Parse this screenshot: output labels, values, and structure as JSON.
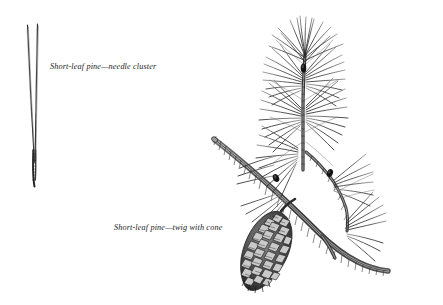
{
  "plate": {
    "background_color": "#ffffff",
    "ink_color": "#1b1b1b",
    "subject": "Short-leaf pine",
    "medium": "pen-and-ink botanical illustration"
  },
  "captions": {
    "needle_cluster": "Short-leaf pine—needle cluster",
    "twig_with_cone": "Short-leaf pine—twig with cone"
  },
  "figures": [
    {
      "id": "needle-cluster",
      "label": "Short-leaf pine—needle cluster",
      "needle_count": 2,
      "description": "two long slender needles joined at a basal sheath"
    },
    {
      "id": "twig-with-cone",
      "label": "Short-leaf pine—twig with cone",
      "description": "branch with needle tufts, dark buds and a mature seed cone",
      "bud_count": 3,
      "cone_count": 1
    }
  ]
}
